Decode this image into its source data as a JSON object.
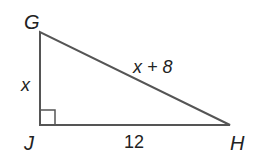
{
  "diagram": {
    "type": "right-triangle",
    "vertices": {
      "G": "G",
      "J": "J",
      "H": "H"
    },
    "sides": {
      "GJ": "x",
      "GH": "x + 8",
      "JH": "12"
    },
    "right_angle_at": "J",
    "colors": {
      "stroke": "#555555",
      "text": "#222222"
    }
  }
}
